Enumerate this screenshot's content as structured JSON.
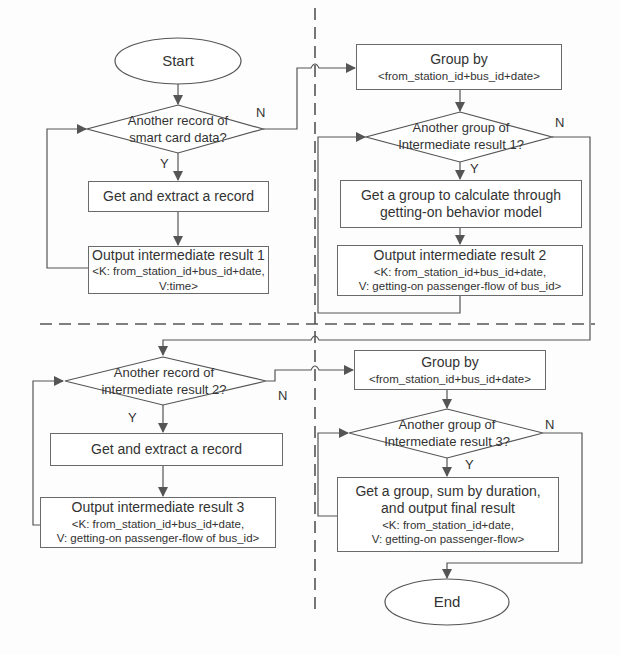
{
  "diagram": {
    "type": "flowchart",
    "colors": {
      "line": "#555555",
      "border": "#6a6a6a",
      "text": "#333333",
      "background": "#fdfdfd"
    },
    "left_top": {
      "start": "Start",
      "decision": [
        "Another record of",
        "smart card data?"
      ],
      "decision_yes": "Y",
      "decision_no": "N",
      "process": "Get and extract a record",
      "output_title": "Output intermediate result 1",
      "output_key": "<K: from_station_id+bus_id+date,",
      "output_value": "V:time>"
    },
    "right_top": {
      "group_title": "Group by",
      "group_key": "<from_station_id+bus_id+date>",
      "decision": [
        "Another group of",
        "Intermediate result 1?"
      ],
      "decision_yes": "Y",
      "decision_no": "N",
      "process": [
        "Get a group to calculate through",
        "getting-on behavior model"
      ],
      "output_title": "Output intermediate result 2",
      "output_key": "<K: from_station_id+bus_id+date,",
      "output_value": "V: getting-on passenger-flow of bus_id>"
    },
    "left_bottom": {
      "decision": [
        "Another record of",
        "intermediate result 2?"
      ],
      "decision_yes": "Y",
      "decision_no": "N",
      "process": "Get and extract a record",
      "output_title": "Output intermediate result 3",
      "output_key": "<K: from_station_id+bus_id+date,",
      "output_value": "V: getting-on passenger-flow of bus_id>"
    },
    "right_bottom": {
      "group_title": "Group by",
      "group_key": "<from_station_id+bus_id+date>",
      "decision": [
        "Another group of",
        "Intermediate result 3?"
      ],
      "decision_yes": "Y",
      "decision_no": "N",
      "process": [
        "Get a group, sum by duration,",
        "and output final result"
      ],
      "output_key": "<K: from_station_id+date,",
      "output_value": "V: getting-on passenger-flow>",
      "end": "End"
    }
  }
}
